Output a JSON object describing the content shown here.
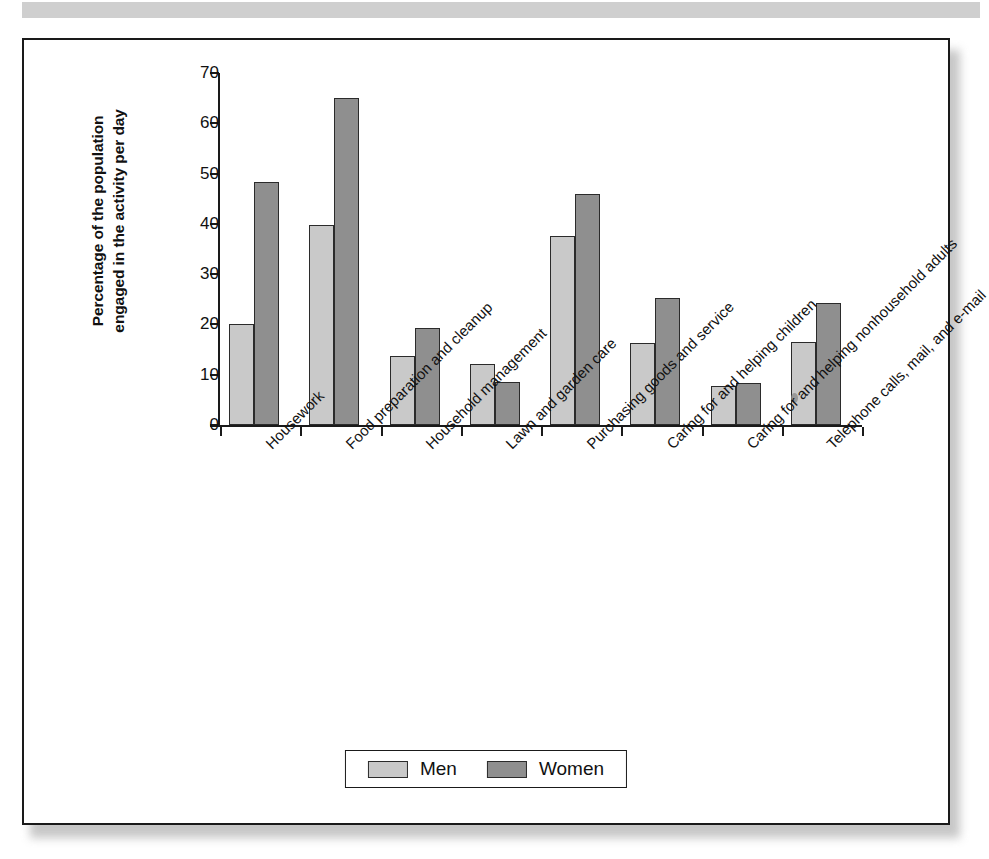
{
  "figure": {
    "background_color": "#ffffff",
    "frame_border_color": "#1a1a1a"
  },
  "legend": {
    "position": "bottom-center",
    "items": [
      {
        "label": "Men",
        "color": "#c9c9c9"
      },
      {
        "label": "Women",
        "color": "#8f8f8f"
      }
    ]
  },
  "axes": {
    "y_axis_label_line1": "Percentage of the population",
    "y_axis_label_line2": "engaged in the activity per day",
    "y_ticks": [
      "0",
      "10",
      "20",
      "30",
      "40",
      "50",
      "60",
      "70"
    ]
  },
  "chart_data": {
    "type": "bar",
    "title": "",
    "subtitle": "",
    "xlabel": "",
    "ylabel": "Percentage of the population engaged in the activity per day",
    "ylim": [
      0,
      70
    ],
    "ytick_interval": 10,
    "grid": false,
    "legend_position": "bottom-center",
    "categories": [
      "Housework",
      "Food preparation and cleanup",
      "Household management",
      "Lawn and garden care",
      "Purchasing goods and service",
      "Caring for and helping children",
      "Caring for and helping nonhousehold adults",
      "Telephone calls, mail, and e-mail"
    ],
    "series": [
      {
        "name": "Men",
        "color": "#c9c9c9",
        "values": [
          20.1,
          39.7,
          13.8,
          12.2,
          37.5,
          16.4,
          7.8,
          16.6
        ]
      },
      {
        "name": "Women",
        "color": "#8f8f8f",
        "values": [
          48.4,
          65.0,
          19.2,
          8.6,
          45.9,
          25.3,
          8.4,
          24.3
        ]
      }
    ]
  }
}
